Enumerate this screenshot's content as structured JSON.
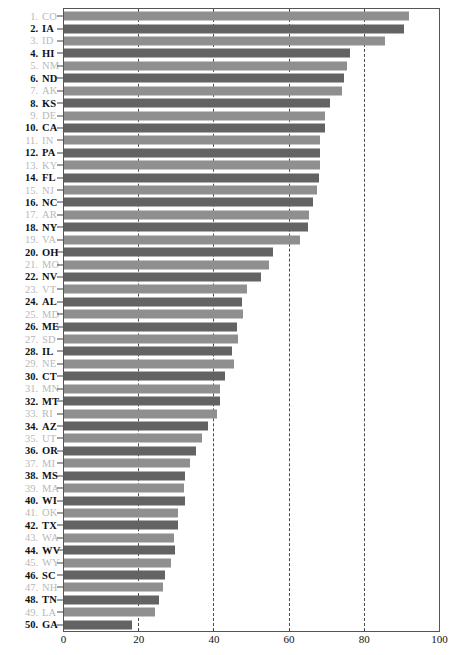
{
  "chart_data": {
    "type": "bar",
    "orientation": "horizontal",
    "title": "",
    "xlabel": "",
    "ylabel": "",
    "xlim": [
      0,
      100
    ],
    "xticks": [
      0,
      20,
      40,
      60,
      80,
      100
    ],
    "grid": true,
    "gridlines_at": [
      20,
      40,
      60,
      80
    ],
    "legend": "none",
    "categories": [
      "CO",
      "IA",
      "ID",
      "HI",
      "NM",
      "ND",
      "AK",
      "KS",
      "DE",
      "CA",
      "IN",
      "PA",
      "KY",
      "FL",
      "NJ",
      "NC",
      "AR",
      "NY",
      "VA",
      "OH",
      "MO",
      "NV",
      "VT",
      "AL",
      "MD",
      "ME",
      "SD",
      "IL",
      "NE",
      "CT",
      "MN",
      "MT",
      "RI",
      "AZ",
      "UT",
      "OR",
      "MI",
      "MS",
      "MA",
      "WI",
      "OK",
      "TX",
      "WA",
      "WV",
      "WY",
      "SC",
      "NH",
      "TN",
      "LA",
      "GA"
    ],
    "ranks": [
      1,
      2,
      3,
      4,
      5,
      6,
      7,
      8,
      9,
      10,
      11,
      12,
      13,
      14,
      15,
      16,
      17,
      18,
      19,
      20,
      21,
      22,
      23,
      24,
      25,
      26,
      27,
      28,
      29,
      30,
      31,
      32,
      33,
      34,
      35,
      36,
      37,
      38,
      39,
      40,
      41,
      42,
      43,
      44,
      45,
      46,
      47,
      48,
      49,
      50
    ],
    "values": [
      91.8,
      90.5,
      85.3,
      76.0,
      75.2,
      74.6,
      74.0,
      70.8,
      69.3,
      69.5,
      68.0,
      68.2,
      68.0,
      67.8,
      67.2,
      66.3,
      65.2,
      64.9,
      62.7,
      55.5,
      54.6,
      52.4,
      48.6,
      47.3,
      47.5,
      46.0,
      46.4,
      44.7,
      45.1,
      42.9,
      41.4,
      41.6,
      40.7,
      38.2,
      36.7,
      35.2,
      33.6,
      32.3,
      32.0,
      32.3,
      30.3,
      30.2,
      29.3,
      29.4,
      28.5,
      26.9,
      26.2,
      25.3,
      24.2,
      18.1
    ]
  },
  "style": {
    "bar_color_odd": "#8f8f8f",
    "bar_color_even": "#636363",
    "label_color_odd": "#b9b9b9",
    "label_color_even": "#111111",
    "gridline_color": "#4a4a4a",
    "frame_color": "#555555"
  }
}
